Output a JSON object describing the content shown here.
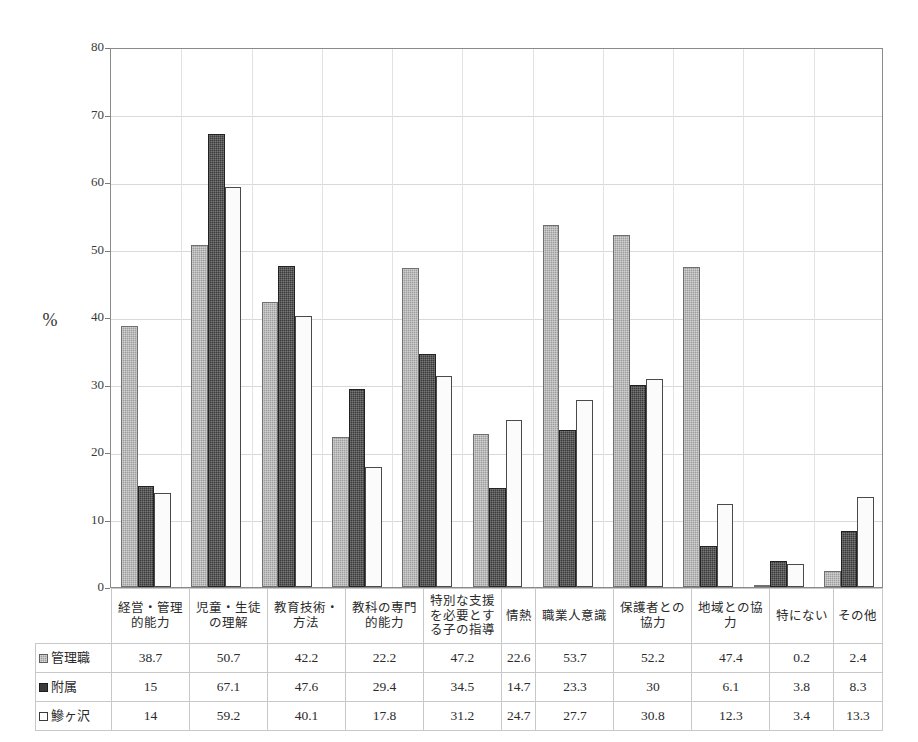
{
  "chart_data": {
    "type": "bar",
    "title": "",
    "xlabel": "",
    "ylabel": "%",
    "ylim": [
      0,
      80
    ],
    "ytick_step": 10,
    "yticks": [
      0,
      10,
      20,
      30,
      40,
      50,
      60,
      70,
      80
    ],
    "grid": true,
    "legend_position": "table-row-headers",
    "categories": [
      "経営・管理\n的能力",
      "児童・生徒\nの理解",
      "教育技術・\n方法",
      "教科の専門\n的能力",
      "特別な支援\nを必要とす\nる子の指導",
      "情熱",
      "職業人意識",
      "保護者との\n協力",
      "地域との協\n力",
      "特にない",
      "その他"
    ],
    "series": [
      {
        "name": "管理職",
        "swatch": "hatched-gray",
        "values": [
          38.7,
          50.7,
          42.2,
          22.2,
          47.2,
          22.6,
          53.7,
          52.2,
          47.4,
          0.2,
          2.4
        ],
        "labels": [
          "38.7",
          "50.7",
          "42.2",
          "22.2",
          "47.2",
          "22.6",
          "53.7",
          "52.2",
          "47.4",
          "0.2",
          "2.4"
        ]
      },
      {
        "name": "附属",
        "swatch": "solid-dark",
        "values": [
          15,
          67.1,
          47.6,
          29.4,
          34.5,
          14.7,
          23.3,
          30,
          6.1,
          3.8,
          8.3
        ],
        "labels": [
          "15",
          "67.1",
          "47.6",
          "29.4",
          "34.5",
          "14.7",
          "23.3",
          "30",
          "6.1",
          "3.8",
          "8.3"
        ]
      },
      {
        "name": "鰺ヶ沢",
        "swatch": "white-outline",
        "values": [
          14,
          59.2,
          40.1,
          17.8,
          31.2,
          24.7,
          27.7,
          30.8,
          12.3,
          3.4,
          13.3
        ],
        "labels": [
          "14",
          "59.2",
          "40.1",
          "17.8",
          "31.2",
          "24.7",
          "27.7",
          "30.8",
          "12.3",
          "3.4",
          "13.3"
        ]
      }
    ],
    "colors": {
      "series_0": "#9d9d9d",
      "series_1": "#3b3b3b",
      "series_2": "#ffffff",
      "gridline": "#d9d9d9",
      "axis": "#8a8a8a"
    }
  }
}
